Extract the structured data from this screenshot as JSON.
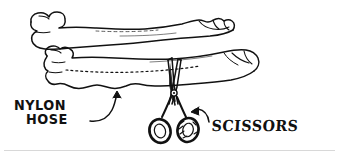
{
  "figure": {
    "kind": "line-art-illustration",
    "style": "black ink hand-drawn outline on white",
    "ink_color": "#111111",
    "background_color": "#ffffff",
    "rule_color": "#d8d8d8"
  },
  "labels": {
    "nylon": "NYLON",
    "hose": "HOSE",
    "scissors": "SCISSORS"
  },
  "annotations": {
    "nylon_arrow": "curved-arrow-pointing-up-right-to-stocking",
    "scissors_arrow": "curved-arrow-pointing-left-to-scissor-handles",
    "cut_line": "dotted-cutting-guide-line-along-stocking-leg"
  },
  "icons": {
    "stocking": "nylon-stocking-icon",
    "scissors": "scissors-icon",
    "arrow": "curved-arrow-icon"
  }
}
